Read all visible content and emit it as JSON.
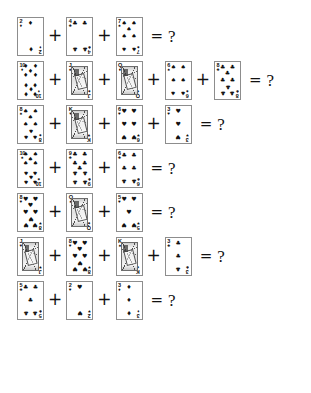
{
  "page": {
    "equals_symbol": "=",
    "question_symbol": "?",
    "plus_symbol": "+",
    "ink_color": "#111111",
    "card_border_color": "#8d8d8d",
    "background_color": "#ffffff"
  },
  "suits": {
    "spade": "♠",
    "heart": "♥",
    "diamond": "♦",
    "club": "♣"
  },
  "rows": [
    {
      "index": 1,
      "cards": [
        {
          "rank": "2",
          "suit": "diamond",
          "suit_name": "diamonds",
          "value": 2,
          "court": false
        },
        {
          "rank": "4",
          "suit": "club",
          "suit_name": "clubs",
          "value": 4,
          "court": false
        },
        {
          "rank": "7",
          "suit": "spade",
          "suit_name": "spades",
          "value": 7,
          "court": false
        }
      ]
    },
    {
      "index": 2,
      "cards": [
        {
          "rank": "10",
          "suit": "diamond",
          "suit_name": "diamonds",
          "value": 10,
          "court": false
        },
        {
          "rank": "J",
          "suit": "spade",
          "suit_name": "spades",
          "value": 11,
          "court": true
        },
        {
          "rank": "Q",
          "suit": "diamond",
          "suit_name": "diamonds",
          "value": 12,
          "court": true
        },
        {
          "rank": "6",
          "suit": "spade",
          "suit_name": "spades",
          "value": 6,
          "court": false
        },
        {
          "rank": "8",
          "suit": "club",
          "suit_name": "clubs",
          "value": 8,
          "court": false
        }
      ]
    },
    {
      "index": 3,
      "cards": [
        {
          "rank": "8",
          "suit": "spade",
          "suit_name": "spades",
          "value": 8,
          "court": false
        },
        {
          "rank": "K",
          "suit": "heart",
          "suit_name": "hearts",
          "value": 13,
          "court": true
        },
        {
          "rank": "6",
          "suit": "heart",
          "suit_name": "hearts",
          "value": 6,
          "court": false
        },
        {
          "rank": "3",
          "suit": "heart",
          "suit_name": "hearts",
          "value": 3,
          "court": false
        }
      ]
    },
    {
      "index": 4,
      "cards": [
        {
          "rank": "10",
          "suit": "spade",
          "suit_name": "spades",
          "value": 10,
          "court": false
        },
        {
          "rank": "9",
          "suit": "club",
          "suit_name": "clubs",
          "value": 9,
          "court": false
        },
        {
          "rank": "6",
          "suit": "club",
          "suit_name": "clubs",
          "value": 6,
          "court": false
        }
      ]
    },
    {
      "index": 5,
      "cards": [
        {
          "rank": "8",
          "suit": "heart",
          "suit_name": "hearts",
          "value": 8,
          "court": false
        },
        {
          "rank": "Q",
          "suit": "spade",
          "suit_name": "spades",
          "value": 12,
          "court": true
        },
        {
          "rank": "5",
          "suit": "heart",
          "suit_name": "hearts",
          "value": 5,
          "court": false
        }
      ]
    },
    {
      "index": 6,
      "cards": [
        {
          "rank": "J",
          "suit": "heart",
          "suit_name": "hearts",
          "value": 11,
          "court": true
        },
        {
          "rank": "8",
          "suit": "heart",
          "suit_name": "hearts",
          "value": 8,
          "court": false
        },
        {
          "rank": "K",
          "suit": "spade",
          "suit_name": "spades",
          "value": 13,
          "court": true
        },
        {
          "rank": "3",
          "suit": "club",
          "suit_name": "clubs",
          "value": 3,
          "court": false
        }
      ]
    },
    {
      "index": 7,
      "cards": [
        {
          "rank": "5",
          "suit": "club",
          "suit_name": "clubs",
          "value": 5,
          "court": false
        },
        {
          "rank": "2",
          "suit": "heart",
          "suit_name": "hearts",
          "value": 2,
          "court": false
        },
        {
          "rank": "3",
          "suit": "diamond",
          "suit_name": "diamonds",
          "value": 3,
          "court": false
        }
      ]
    }
  ]
}
